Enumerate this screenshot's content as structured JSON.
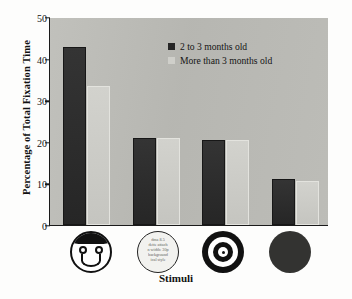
{
  "chart_data": {
    "type": "bar",
    "title": "",
    "xlabel": "Stimuli",
    "ylabel": "Percentage of Total Fixation Time",
    "ylim": [
      0,
      50
    ],
    "yticks": [
      0,
      10,
      20,
      30,
      40,
      50
    ],
    "grid": false,
    "legend_position": "top-center",
    "categories": [
      "face",
      "scrambled-face",
      "bullseye",
      "solid-disc"
    ],
    "category_icons": [
      "smiley-face-icon",
      "scrambled-face-icon",
      "bullseye-icon",
      "solid-disc-icon"
    ],
    "series": [
      {
        "name": "2 to 3 months old",
        "color": "#2e2e2e",
        "values": [
          42.7,
          21.0,
          20.5,
          11.0
        ]
      },
      {
        "name": "More than 3 months old",
        "color": "#cbcbc6",
        "values": [
          33.4,
          21.0,
          20.5,
          10.5
        ]
      }
    ],
    "scrambled_icon_text": [
      "dma 8.5",
      "dette attach",
      "n width: 30p",
      "background",
      "ical style"
    ]
  },
  "colors": {
    "plot_background": "#b9b9b4",
    "axis": "#1a1a1a",
    "page_background": "#fdfdfc",
    "series_dark": "#2e2e2e",
    "series_light": "#cbcbc6"
  }
}
